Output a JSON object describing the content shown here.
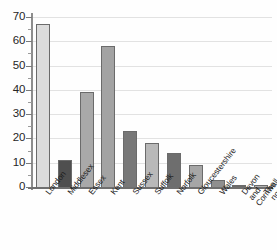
{
  "chart_data": {
    "type": "bar",
    "title": "",
    "subtitle": "",
    "xlabel": "",
    "ylabel": "",
    "ylim": [
      0,
      70
    ],
    "ytick_step": 10,
    "ytick_labels": [
      "0",
      "10",
      "20",
      "30",
      "40",
      "50",
      "60",
      "70"
    ],
    "grid": true,
    "grid_orientation": "horizontal",
    "legend": false,
    "legend_position": "none",
    "categories": [
      "London",
      "Middlesex",
      "Essex",
      "Kent",
      "Sussex",
      "Suffolk",
      "Norfolk",
      "Gloucestershire",
      "Wales",
      "Devon and\nCornwall",
      "The north of\nEngland"
    ],
    "values": [
      67,
      11,
      39,
      58,
      23,
      18,
      14,
      9,
      3,
      1,
      1
    ],
    "bar_colors": [
      "#dcdcdc",
      "#4f4f4f",
      "#a9a9a9",
      "#a3a3a3",
      "#787878",
      "#b9b9b9",
      "#6e6e6e",
      "#a6a6a6",
      "#8f8f8f",
      "#6b6b6b",
      "#b0b0b0"
    ]
  },
  "axes": {
    "y_ticks": [
      0,
      10,
      20,
      30,
      40,
      50,
      60,
      70
    ],
    "y_minor_ticks": [
      5,
      15,
      25,
      35,
      45,
      55,
      65
    ]
  },
  "colors": {
    "gridline": "#e2e2e2",
    "axis": "#7a7a7a",
    "bar_border": "#6b6b6b",
    "text": "#1c1c1c",
    "background": "#fefefe"
  }
}
